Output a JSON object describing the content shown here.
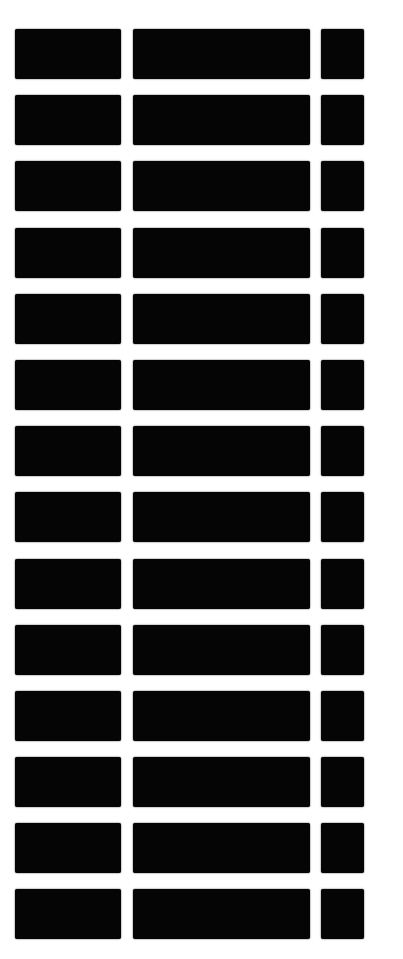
{
  "image": {
    "description": "Scanned photograph of a white surface with a regular grid of black rectangles",
    "background_color": "#ffffff",
    "block_color": "#050505",
    "rows": 14,
    "columns": 3,
    "column_widths_px": [
      106,
      177,
      43
    ],
    "row_height_px": 50,
    "gap_px": 16
  }
}
